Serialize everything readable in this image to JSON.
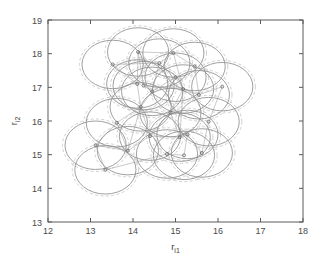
{
  "figure": {
    "background": "#ffffff",
    "frame_color": "#5a5a5a",
    "solid_circle_color": "#8f8f8f",
    "dashed_circle_color": "#c9c9c9",
    "edge_color": "#b3b3b3",
    "marker_color": "#707070"
  },
  "chart_data": {
    "type": "scatter",
    "title": "",
    "subtitle": "",
    "xlabel": "r",
    "xlabel_sub": "i1",
    "ylabel": "r",
    "ylabel_sub": "i2",
    "xlim": [
      12,
      18
    ],
    "ylim": [
      13,
      19
    ],
    "xticks": [
      12,
      13,
      14,
      15,
      16,
      17,
      18
    ],
    "yticks": [
      13,
      14,
      15,
      16,
      17,
      18,
      19
    ],
    "xtick_labels": [
      "12",
      "13",
      "14",
      "15",
      "16",
      "17",
      "18"
    ],
    "ytick_labels": [
      "13",
      "14",
      "15",
      "16",
      "17",
      "18",
      "19"
    ],
    "grid": false,
    "legend": null,
    "legend_position": "none",
    "solid_radius": 0.72,
    "dashed_radius": 0.78,
    "series": [
      {
        "name": "node centers",
        "marker": "circle",
        "x": [
          13.12,
          13.35,
          13.52,
          13.62,
          13.88,
          14.1,
          14.12,
          14.18,
          14.25,
          14.4,
          14.45,
          14.62,
          14.8,
          14.88,
          14.95,
          15.0,
          15.1,
          15.18,
          15.2,
          15.28,
          15.45,
          15.55,
          15.62,
          15.78,
          16.1
        ],
        "y": [
          15.28,
          14.55,
          17.68,
          15.95,
          15.12,
          17.1,
          18.05,
          16.42,
          17.05,
          15.55,
          16.88,
          17.72,
          15.02,
          16.25,
          18.02,
          17.3,
          15.52,
          16.95,
          14.98,
          15.6,
          17.62,
          16.78,
          15.05,
          15.98,
          17.02
        ]
      }
    ],
    "edges": [
      [
        0,
        3
      ],
      [
        0,
        4
      ],
      [
        3,
        4
      ],
      [
        3,
        7
      ],
      [
        4,
        7
      ],
      [
        4,
        9
      ],
      [
        7,
        9
      ],
      [
        7,
        10
      ],
      [
        2,
        5
      ],
      [
        2,
        11
      ],
      [
        5,
        6
      ],
      [
        5,
        7
      ],
      [
        6,
        8
      ],
      [
        8,
        10
      ],
      [
        10,
        11
      ],
      [
        9,
        13
      ],
      [
        9,
        16
      ],
      [
        13,
        16
      ],
      [
        13,
        17
      ],
      [
        16,
        17
      ],
      [
        16,
        19
      ],
      [
        12,
        18
      ],
      [
        12,
        16
      ],
      [
        18,
        19
      ],
      [
        19,
        22
      ],
      [
        17,
        21
      ],
      [
        21,
        24
      ],
      [
        14,
        20
      ],
      [
        14,
        17
      ],
      [
        20,
        21
      ],
      [
        22,
        23
      ],
      [
        23,
        24
      ],
      [
        11,
        14
      ],
      [
        8,
        17
      ],
      [
        1,
        0
      ],
      [
        1,
        12
      ],
      [
        15,
        17
      ],
      [
        15,
        10
      ],
      [
        6,
        14
      ]
    ]
  }
}
